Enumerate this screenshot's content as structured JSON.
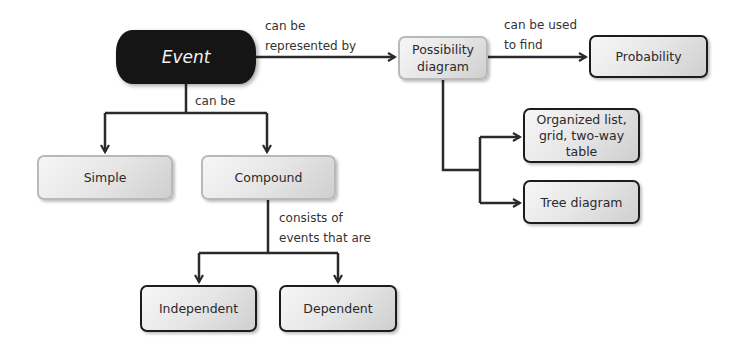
{
  "diagram": {
    "type": "concept-map",
    "nodes": {
      "event": "Event",
      "possibility_diagram": "Possibility diagram",
      "probability": "Probability",
      "organized_list": "Organized list, grid, two-way table",
      "tree_diagram": "Tree diagram",
      "simple": "Simple",
      "compound": "Compound",
      "independent": "Independent",
      "dependent": "Dependent"
    },
    "edge_labels": {
      "event_to_possibility_1": "can be",
      "event_to_possibility_2": "represented by",
      "possibility_to_probability_1": "can be used",
      "possibility_to_probability_2": "to find",
      "event_to_types": "can be",
      "compound_to_kinds_1": "consists of",
      "compound_to_kinds_2": "events that are"
    },
    "edges": [
      {
        "from": "Event",
        "to": "Possibility diagram",
        "label": "can be represented by"
      },
      {
        "from": "Possibility diagram",
        "to": "Probability",
        "label": "can be used to find"
      },
      {
        "from": "Possibility diagram",
        "to": "Organized list, grid, two-way table",
        "label": ""
      },
      {
        "from": "Possibility diagram",
        "to": "Tree diagram",
        "label": ""
      },
      {
        "from": "Event",
        "to": "Simple",
        "label": "can be"
      },
      {
        "from": "Event",
        "to": "Compound",
        "label": "can be"
      },
      {
        "from": "Compound",
        "to": "Independent",
        "label": "consists of events that are"
      },
      {
        "from": "Compound",
        "to": "Dependent",
        "label": "consists of events that are"
      }
    ],
    "colors": {
      "root_fill": "#151515",
      "node_fill": "#e6e6e6",
      "line": "#2a2a2a",
      "soft_border": "#b9b9b9",
      "hard_border": "#1c1c1c"
    }
  }
}
